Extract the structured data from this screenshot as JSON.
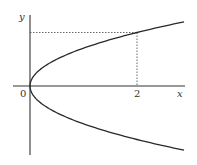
{
  "diagram": {
    "type": "function-graph",
    "axes": {
      "x_label": "x",
      "y_label": "y",
      "origin_label": "0"
    },
    "x_marks": [
      {
        "value": 2,
        "label": "2"
      }
    ],
    "curve": {
      "kind": "parabola",
      "equation": "y^2 = x/2",
      "vertex": [
        0,
        0
      ],
      "opens": "right",
      "x_max": 2.88
    },
    "highlighted_point": {
      "x": 2,
      "y": 1,
      "branch": "upper",
      "guide_lines": "dotted"
    },
    "colors": {
      "ink": "#2a2a2a",
      "background": "#ffffff"
    }
  }
}
